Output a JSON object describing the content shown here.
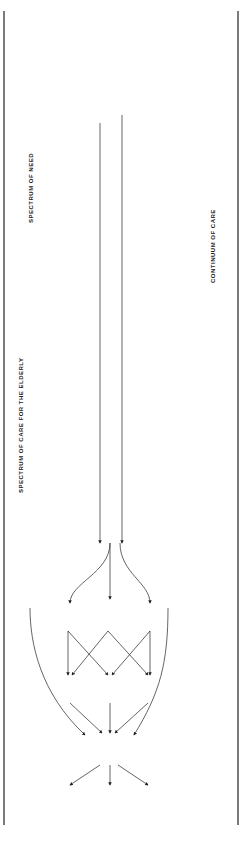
{
  "headers": {
    "spectrum_of_need": "SPECTRUM OF NEED",
    "spectrum_of_care": "SPECTRUM OF CARE FOR THE ELDERLY",
    "continuum_of_care": "CONTINUUM OF CARE",
    "cooperation": "Adequate co-operation between Local Authority and Health Services"
  },
  "needs": [
    "Fit\nelderly\nsupporting\nothers",
    "Fit\nelderly\nwith some\nsocial\nproblems",
    "Frail\nelderly\nsupported\nby\nfamily",
    "Frail\nelderly\nsupported\nby\nstatutory/\nvoluntary\nservices",
    "Disabled\nelderly\nsupported\nby\nday care\netc.",
    "Disabled\nelderly\nin Part IV\naccommodation"
  ],
  "continuum": [
    "Attitudes\ntowards\nelderly.\n\nPosition of\nelderly in\nsociety.\n\nRetirement\npolicies\netc.",
    "Voluntary\nagencies\nsheltered\nhousing",
    "Good\nsocial\nwork.\n\nsheltered\nhousing,\nrespite\nadmissions\netc.",
    "Adequate\nHome Help\nServices\n\nGood GP\nCommunity\nNursing\nServices\netc.",
    "Adequate\nDay Centre,\nDay Hosp.\nServices\nRespite\nAdmissions\nas\nappropriate",
    "Adequate\nPart IV\nAccommodation\nFlexible\nAdmission\nPolicies\nRespite\nCare"
  ],
  "client_groups": [
    "Mentally infirm\nElderly",
    "Elderly with\ncombined physical and\nmental infirmity",
    "Physically\ninfirm elderly"
  ],
  "care_services": [
    "Psychiatric\nServices",
    "Geriatric and\nPsychogeriatric\nServices",
    "Geriatric\nServices"
  ],
  "acute_episodes": "Acute\nEpisodes\n\"Medical\"\n\"Social\"\n\"Medicosocial\"",
  "wards": [
    "Acute Medical\nWards",
    "Orthopaedic\nWards",
    "Geriatric\nWards"
  ],
  "blockage_label": "blockage",
  "outflows": [
    "Home",
    "Part IV",
    "Longstay\nGeriatric Care",
    "Longstay\nPsychiatric Care"
  ],
  "notes": {
    "services": "Adequate Geriatric\nand Psychiatric Services\nGood Coordination of\nInstitutional and\nCommunity Care",
    "balance": "Proper balance\nof resources\nCoordinated\nPlanning",
    "acute_chronic": "Proper balance\nof resources\nAcute and Chronic",
    "outflow": "Adequate\noutflow\nchannels"
  }
}
